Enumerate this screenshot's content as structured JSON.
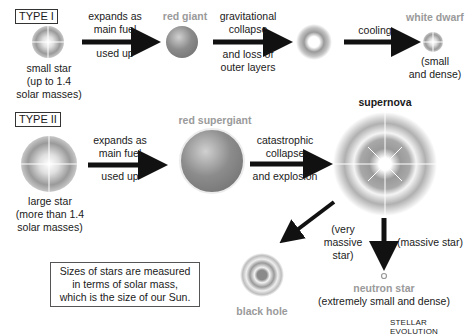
{
  "diagram": {
    "footer_title": "STELLAR EVOLUTION",
    "note": [
      "Sizes of stars are measured",
      "in terms of solar mass,",
      "which is the size of our Sun."
    ],
    "type1": {
      "label": "TYPE I",
      "start": {
        "caption": [
          "small star",
          "(up to 1.4",
          "solar masses)"
        ]
      },
      "arrow1": {
        "top": [
          "expands as",
          "main fuel"
        ],
        "bottom": [
          "used up"
        ]
      },
      "stage2": {
        "label": "red giant"
      },
      "arrow2": {
        "top": [
          "gravitational",
          "collapse"
        ],
        "bottom": [
          "and loss of",
          "outer layers"
        ]
      },
      "arrow3": {
        "top": [
          "cooling"
        ]
      },
      "end": {
        "label": "white dwarf",
        "caption": [
          "(small",
          "and dense)"
        ]
      }
    },
    "type2": {
      "label": "TYPE II",
      "start": {
        "caption": [
          "large star",
          "(more than 1.4",
          "solar masses)"
        ]
      },
      "arrow1": {
        "top": [
          "expands as",
          "main fuel"
        ],
        "bottom": [
          "used up"
        ]
      },
      "stage2": {
        "label": "red supergiant"
      },
      "arrow2": {
        "top": [
          "catastrophic",
          "collapse"
        ],
        "bottom": [
          "and explosion"
        ]
      },
      "stage3": {
        "label": "supernova"
      },
      "branch_left": {
        "label": [
          "(very",
          "massive",
          "star)"
        ],
        "result": "black hole"
      },
      "branch_down": {
        "label": [
          "(massive star)"
        ],
        "result": "neutron star",
        "caption": [
          "(extremely small and dense)"
        ]
      }
    },
    "colors": {
      "text": "#1a1a1a",
      "grey_label": "#9a9a9a",
      "arrow": "#111111",
      "star": "#888888"
    }
  }
}
